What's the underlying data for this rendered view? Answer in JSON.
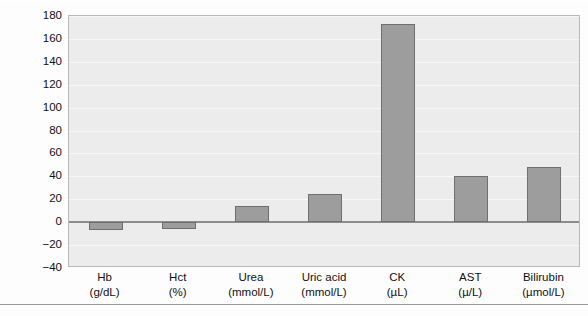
{
  "chart_data": {
    "type": "bar",
    "title": "",
    "xlabel": "",
    "ylabel": "Exercise-induced change (%)",
    "ylim": [
      -40,
      180
    ],
    "yticks": [
      180,
      160,
      140,
      120,
      100,
      80,
      60,
      40,
      20,
      0,
      -20,
      -40
    ],
    "ytick_labels": [
      "180",
      "160",
      "140",
      "120",
      "100",
      "80",
      "60",
      "40",
      "20",
      "0",
      "−20",
      "−40"
    ],
    "grid": true,
    "legend": "none",
    "categories": [
      {
        "name": "Hb",
        "unit": "(g/dL)"
      },
      {
        "name": "Hct",
        "unit": "(%)"
      },
      {
        "name": "Urea",
        "unit": "(mmol/L)"
      },
      {
        "name": "Uric acid",
        "unit": "(mmol/L)"
      },
      {
        "name": "CK",
        "unit": "(µL)"
      },
      {
        "name": "AST",
        "unit": "(µ/L)"
      },
      {
        "name": "Bilirubin",
        "unit": "(µmol/L)"
      }
    ],
    "values": [
      -7,
      -6,
      14,
      25,
      173,
      40,
      48
    ],
    "colors": {
      "bar_fill": "#9d9d9d",
      "bar_edge": "#6f6f6f",
      "plot_background": "#ececec",
      "gridline": "#f7f7f7",
      "zero_line": "#8c8c8c",
      "text": "#111111"
    }
  }
}
